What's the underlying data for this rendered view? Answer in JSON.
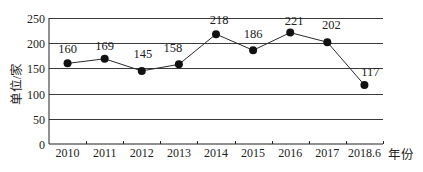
{
  "chart_data": {
    "type": "line",
    "title": "",
    "xlabel": "年份",
    "ylabel": "单位/家",
    "categories": [
      "2010",
      "2011",
      "2012",
      "2013",
      "2014",
      "2015",
      "2016",
      "2017",
      "2018.6"
    ],
    "series": [
      {
        "name": "",
        "values": [
          160,
          169,
          145,
          158,
          218,
          186,
          221,
          202,
          117
        ],
        "data_labels": [
          "160",
          "169",
          "145",
          "158",
          "218",
          "186",
          "221",
          "202",
          "117"
        ]
      }
    ],
    "ylim": [
      0,
      250
    ],
    "yticks": [
      0,
      50,
      100,
      150,
      200,
      250
    ],
    "ytick_labels": [
      "0",
      "50",
      "100",
      "150",
      "200",
      "250"
    ],
    "grid": true,
    "legend": "none",
    "marker": "filled-circle",
    "colors": {
      "line": "#2a2a2a",
      "marker": "#111111",
      "grid": "#3a3a3a"
    }
  }
}
